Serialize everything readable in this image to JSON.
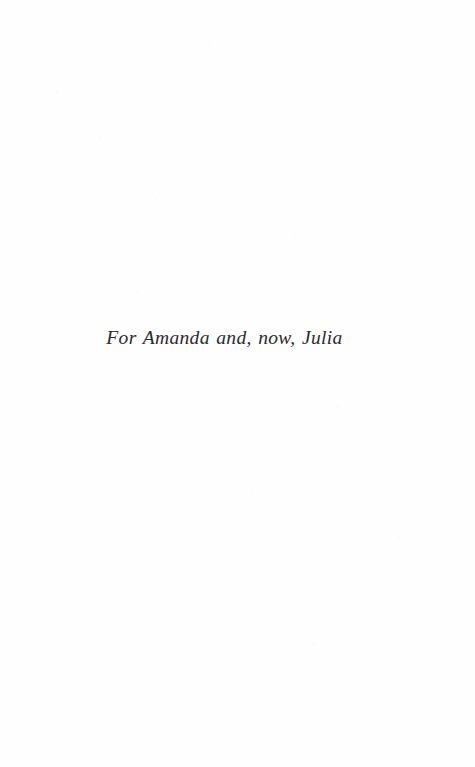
{
  "page": {
    "kind": "book-dedication-page",
    "background_color": "#fefefe",
    "ink_color": "#2b2a2e"
  },
  "dedication": {
    "text": "For Amanda and, now, Julia"
  }
}
